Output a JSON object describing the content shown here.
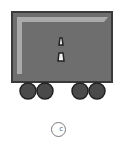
{
  "figure": {
    "colors": {
      "body": "#6e6e6e",
      "body_border": "#3a3a3a",
      "highlight": "#b5b5b5",
      "wheel": "#4a4a4a",
      "wheel_border": "#222222",
      "marker": "#f2f2f2"
    },
    "wheels": 4,
    "markers": 2
  },
  "option": {
    "label": "c",
    "selected": false
  }
}
